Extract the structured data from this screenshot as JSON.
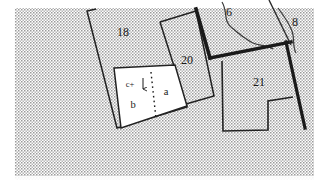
{
  "map": {
    "type": "cadastral-plat-map",
    "background_fill": "#ffffff",
    "stipple_color": "#8d8d8d",
    "line_color": "#1a1a1a",
    "white_parcel_fill": "#ffffff",
    "stipple_region": {
      "x": 14,
      "y": 8,
      "width": 300,
      "height": 172
    },
    "parcels": [
      {
        "id": "parcel-18",
        "label": "18",
        "label_x": 123,
        "label_y": 36,
        "fill": "stipple",
        "points": "87,11 161,50 141,71 116,69 111,67 104,64 96,60 89,21"
      },
      {
        "id": "parcel-20",
        "label": "20",
        "label_x": 187,
        "label_y": 62,
        "fill": "stipple",
        "points": "160,22 196,11 213,96 180,107"
      },
      {
        "id": "parcel-6",
        "label": "6",
        "label_x": 228,
        "label_y": 15,
        "fill": "stipple",
        "points": ""
      },
      {
        "id": "parcel-8",
        "label": "8",
        "label_x": 293,
        "label_y": 25,
        "fill": "stipple",
        "points": ""
      },
      {
        "id": "parcel-21",
        "label": "21",
        "label_x": 259,
        "label_y": 85,
        "fill": "stipple",
        "points": "221,60 280,44 292,97 268,102 269,131 222,130"
      },
      {
        "id": "parcel-a",
        "label": "a",
        "label_x": 165,
        "label_y": 95,
        "fill": "#ffffff"
      },
      {
        "id": "parcel-b",
        "label": "b",
        "label_x": 133,
        "label_y": 107,
        "fill": "#ffffff"
      }
    ],
    "annotations": [
      {
        "id": "annotation-c-plus",
        "text": "c+",
        "x": 130,
        "y": 88
      },
      {
        "id": "annotation-arrow",
        "type": "down-arrow",
        "x": 143,
        "y": 80
      }
    ],
    "white_block": {
      "id": "white-parcel-block",
      "points": "114,68 174,65 186,107 122,128",
      "divider": {
        "type": "dotted",
        "x1": 152,
        "y1": 73,
        "x2": 155,
        "y2": 118
      }
    },
    "thick_lines": [
      {
        "id": "thick-line-20-right",
        "x1": 196,
        "y1": 9,
        "x2": 210,
        "y2": 57,
        "width": 3.4
      },
      {
        "id": "thick-line-21-top",
        "x1": 210,
        "y1": 57,
        "x2": 292,
        "y2": 41,
        "width": 3.4
      },
      {
        "id": "thick-line-21-right",
        "x1": 285,
        "y1": 41,
        "x2": 304,
        "y2": 128,
        "width": 3.2
      }
    ],
    "stream_lines": [
      {
        "id": "stream-6",
        "path": "M 222 2 C 228 12 224 20 231 26 C 238 32 244 38 252 42 C 258 45 266 45 272 48"
      },
      {
        "id": "stream-8",
        "path": "M 279 9 C 284 16 288 22 292 30 C 296 38 293 45 296 52"
      }
    ],
    "boundary_lines": [
      {
        "id": "boundary-18-left",
        "x1": 87,
        "y1": 11,
        "x2": 117,
        "y2": 128
      },
      {
        "id": "boundary-18-top",
        "x1": 87,
        "y1": 11,
        "x2": 96,
        "y2": 9
      },
      {
        "id": "boundary-21-notch",
        "x1": 268,
        "y1": 101,
        "x2": 268,
        "y2": 130
      }
    ]
  }
}
